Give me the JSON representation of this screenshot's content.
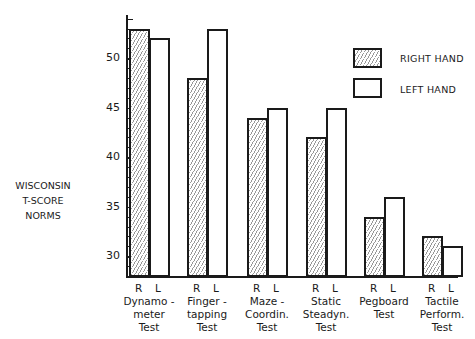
{
  "chart_data": {
    "type": "bar",
    "title": "",
    "xlabel": "",
    "ylabel": "WISCONSIN T-SCORE NORMS",
    "ylim": [
      28,
      55
    ],
    "yticks": [
      30,
      35,
      40,
      45,
      50
    ],
    "grid": false,
    "legend_position": "upper right",
    "categories": [
      "Dynamometer Test",
      "Finger-tapping Test",
      "Maze-Coordin. Test",
      "Static Steadyn. Test",
      "Pegboard Test",
      "Tactile Perform. Test"
    ],
    "category_labels": [
      [
        "Dynamo -",
        "meter",
        "Test"
      ],
      [
        "Finger -",
        "tapping",
        "Test"
      ],
      [
        "Maze -",
        "Coordin.",
        "Test"
      ],
      [
        "Static",
        "Steadyn.",
        "Test"
      ],
      [
        "Pegboard",
        "Test",
        ""
      ],
      [
        "Tactile",
        "Perform.",
        "Test"
      ]
    ],
    "bar_labels": [
      "R",
      "L"
    ],
    "series": [
      {
        "name": "RIGHT HAND",
        "pattern": "hatched",
        "values": [
          53,
          48,
          44,
          42,
          34,
          32
        ]
      },
      {
        "name": "LEFT HAND",
        "pattern": "open",
        "values": [
          52,
          53,
          45,
          45,
          36,
          31
        ]
      }
    ]
  },
  "ylabel_lines": [
    "WISCONSIN",
    "T-SCORE",
    "NORMS"
  ],
  "ytick_labels": [
    "50",
    "45",
    "40",
    "35",
    "30"
  ],
  "legend": {
    "right": "RIGHT HAND",
    "left": "LEFT HAND"
  }
}
